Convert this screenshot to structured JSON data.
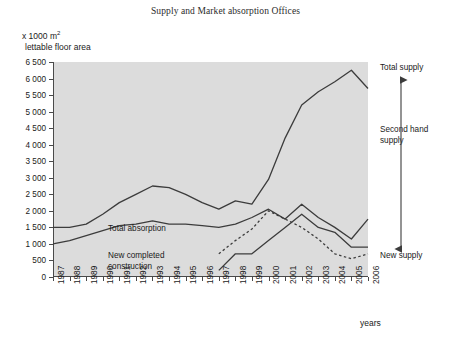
{
  "chart": {
    "title": "Supply and Market absorption Offices",
    "unit_line1_prefix": "x 1000 m",
    "unit_line1_sup": "2",
    "unit_line2": "lettable floor area",
    "xlabel": "years",
    "inline_label_absorption": "Total absorption",
    "inline_label_new_construction": "New completed\nconstruction",
    "right_label_total_supply": "Total supply",
    "right_label_second_hand": "Second hand\nsupply",
    "right_label_new_supply": "New supply",
    "colors": {
      "plot_background": "#dcdcdc",
      "axis": "#4a4a4a",
      "line": "#3c3c3c",
      "text": "#1a1a1a"
    }
  },
  "chart_data": {
    "type": "line",
    "title": "Supply and Market absorption Offices",
    "xlabel": "years",
    "ylabel": "x 1000 m2 lettable floor area",
    "ylim": [
      0,
      6500
    ],
    "ytick_step": 500,
    "grid": false,
    "legend": "inline-annotations",
    "categories": [
      "1987",
      "1988",
      "1989",
      "1990",
      "1991",
      "1992",
      "1993",
      "1994",
      "1995",
      "1996",
      "1997",
      "1998",
      "1999",
      "2000",
      "2001",
      "2002",
      "2003",
      "2004",
      "2005",
      "2006"
    ],
    "yticks": [
      "0",
      "500",
      "1 000",
      "1 500",
      "2 000",
      "2 500",
      "3 000",
      "3 500",
      "4 000",
      "4 500",
      "5 000",
      "5 500",
      "6 000",
      "6 500"
    ],
    "series": [
      {
        "name": "Total supply",
        "style": "solid",
        "values": [
          1500,
          1500,
          1600,
          1900,
          2250,
          2500,
          2750,
          2700,
          2500,
          2250,
          2050,
          2300,
          2200,
          2950,
          4200,
          5200,
          5600,
          5900,
          6250,
          5700
        ]
      },
      {
        "name": "Total absorption",
        "style": "solid",
        "values": [
          1000,
          1100,
          1250,
          1400,
          1550,
          1600,
          1700,
          1600,
          1600,
          1550,
          1500,
          1600,
          1800,
          2050,
          1750,
          2200,
          1800,
          1500,
          1150,
          1750
        ]
      },
      {
        "name": "New completed construction",
        "style": "dashed",
        "values": [
          null,
          null,
          null,
          null,
          null,
          null,
          null,
          null,
          null,
          null,
          700,
          1100,
          1450,
          2000,
          1750,
          1500,
          1150,
          700,
          550,
          700
        ]
      },
      {
        "name": "New supply",
        "style": "solid",
        "values": [
          null,
          null,
          null,
          null,
          null,
          null,
          null,
          null,
          null,
          null,
          200,
          700,
          700,
          1100,
          1500,
          1900,
          1500,
          1350,
          900,
          900
        ]
      }
    ],
    "annotations": [
      {
        "text": "Total supply",
        "position": "right-top"
      },
      {
        "text": "Second hand supply",
        "position": "right-middle",
        "marker": "double-headed-vertical-arrow"
      },
      {
        "text": "New supply",
        "position": "right-bottom"
      },
      {
        "text": "Total absorption",
        "position": "inline"
      },
      {
        "text": "New completed construction",
        "position": "inline"
      }
    ]
  }
}
